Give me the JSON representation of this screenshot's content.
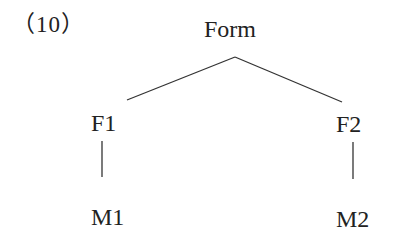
{
  "example_number": "（10）",
  "tree": {
    "root": "Form",
    "children": [
      {
        "label": "F1",
        "child": "M1"
      },
      {
        "label": "F2",
        "child": "M2"
      }
    ]
  }
}
